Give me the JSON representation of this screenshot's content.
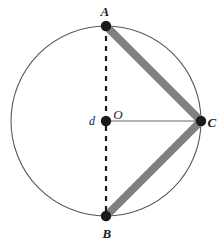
{
  "figure": {
    "background_color": "#ffffff",
    "width": 223,
    "height": 245
  },
  "colors": {
    "circle_stroke": "#595959",
    "chord_thick": "#808080",
    "radius_line": "#6b6b6b",
    "diameter_dashed": "#1a1a1a",
    "point_fill": "#1a1a1a",
    "label_text": "#1a1a1a"
  },
  "circle": {
    "center_x": 106,
    "center_y": 121,
    "radius": 95,
    "stroke_width": 1.1
  },
  "points": [
    {
      "id": "A",
      "label": "A",
      "x": 106,
      "y": 26,
      "radius": 5.2,
      "label_x": 105,
      "label_y": 11
    },
    {
      "id": "B",
      "label": "B",
      "x": 106,
      "y": 216,
      "radius": 5.2,
      "label_x": 107,
      "label_y": 233
    },
    {
      "id": "C",
      "label": "C",
      "x": 201,
      "y": 121,
      "radius": 5.2,
      "label_x": 212,
      "label_y": 122
    },
    {
      "id": "O",
      "label": "O",
      "x": 106,
      "y": 121,
      "radius": 5.2,
      "label_x": 118,
      "label_y": 114
    }
  ],
  "measures": [
    {
      "id": "d",
      "label": "d",
      "label_x": 92,
      "label_y": 121
    }
  ],
  "segments": [
    {
      "id": "AC",
      "from": "A",
      "to": "C",
      "style": "thick-solid",
      "color": "#808080",
      "width": 8,
      "x1": 106,
      "y1": 26,
      "x2": 201,
      "y2": 121
    },
    {
      "id": "BC",
      "from": "B",
      "to": "C",
      "style": "thick-solid",
      "color": "#808080",
      "width": 8,
      "x1": 106,
      "y1": 216,
      "x2": 201,
      "y2": 121
    },
    {
      "id": "AB",
      "from": "A",
      "to": "B",
      "style": "dashed",
      "color": "#1a1a1a",
      "width": 2.2,
      "dash": "5 5",
      "x1": 106,
      "y1": 26,
      "x2": 106,
      "y2": 216
    },
    {
      "id": "OC",
      "from": "O",
      "to": "C",
      "style": "thin-solid",
      "color": "#6b6b6b",
      "width": 1.1,
      "x1": 106,
      "y1": 121,
      "x2": 201,
      "y2": 121
    }
  ]
}
